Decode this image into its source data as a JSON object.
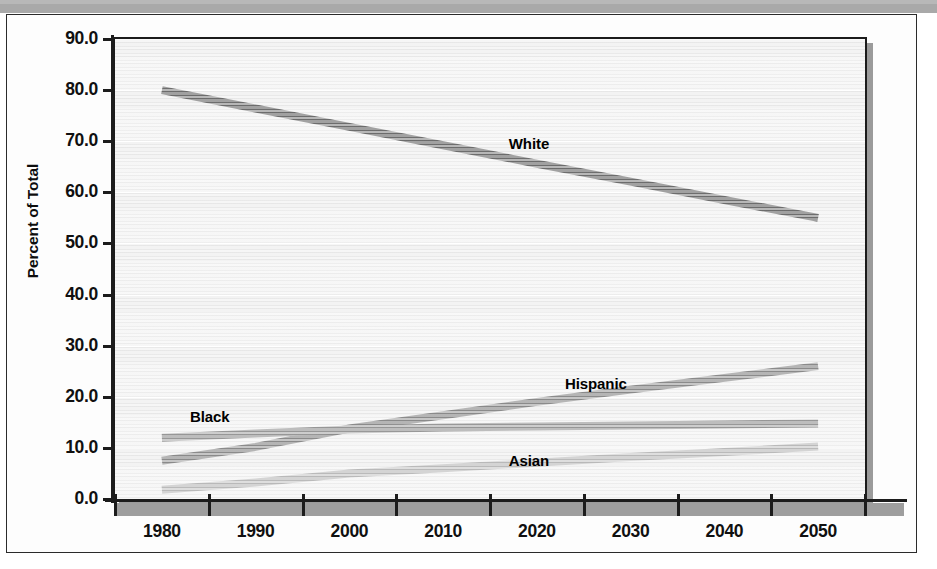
{
  "figure": {
    "y_axis_title": "Percent of Total",
    "y_ticks": [
      "90.0",
      "80.0",
      "70.0",
      "60.0",
      "50.0",
      "40.0",
      "30.0",
      "20.0",
      "10.0",
      "0.0"
    ],
    "x_ticks": [
      "1980",
      "1990",
      "2000",
      "2010",
      "2020",
      "2030",
      "2040",
      "2050"
    ],
    "labels": {
      "white": "White",
      "hispanic": "Hispanic",
      "black": "Black",
      "asian": "Asian"
    },
    "colors": {
      "white_series": "#6f6f6f",
      "hispanic_series": "#8d8d8d",
      "black_series": "#9a9a9a",
      "asian_series": "#bdbdbd",
      "plot_background": "#f2f2f2",
      "axis": "#1c1c1c",
      "plot_shadow": "#9b9b9b"
    }
  },
  "chart_data": {
    "type": "line",
    "title": "",
    "subtitle": "",
    "xlabel": "",
    "ylabel": "Percent of Total",
    "categories": [
      1980,
      1990,
      2000,
      2010,
      2020,
      2030,
      2040,
      2050
    ],
    "ylim": [
      0.0,
      90.0
    ],
    "xlim": [
      1980,
      2050
    ],
    "ytick_interval": 10.0,
    "grid": true,
    "legend": "inline-labels",
    "annotations": [
      {
        "text": "White",
        "x": 2017,
        "y": 69.5
      },
      {
        "text": "Hispanic",
        "x": 2023,
        "y": 22.5
      },
      {
        "text": "Black",
        "x": 1983,
        "y": 16.0
      },
      {
        "text": "Asian",
        "x": 2017,
        "y": 7.5
      }
    ],
    "series": [
      {
        "name": "White",
        "color": "#6f6f6f",
        "values": [
          80.0,
          76.4,
          72.8,
          69.2,
          65.6,
          62.1,
          58.5,
          55.0
        ]
      },
      {
        "name": "Hispanic",
        "color": "#8d8d8d",
        "values": [
          7.5,
          10.2,
          13.8,
          16.4,
          19.0,
          21.4,
          23.7,
          26.0
        ]
      },
      {
        "name": "Black",
        "color": "#9a9a9a",
        "values": [
          12.0,
          12.8,
          13.6,
          14.0,
          14.2,
          14.4,
          14.6,
          14.8
        ]
      },
      {
        "name": "Asian",
        "color": "#bdbdbd",
        "values": [
          1.8,
          3.2,
          5.0,
          6.0,
          7.1,
          8.2,
          9.2,
          10.3
        ]
      }
    ]
  }
}
